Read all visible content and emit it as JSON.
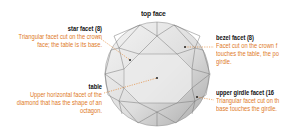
{
  "title": "top face",
  "labels": {
    "star_facet": {
      "heading": "star facet (8)",
      "description_lines": [
        "Triangular facet cut on the crown",
        "face; the table is its base."
      ]
    },
    "table": {
      "heading": "table",
      "description_lines": [
        "Upper horizontal facet of the",
        "diamond that has the shape of an",
        "octagon."
      ]
    },
    "bezel_facet": {
      "heading": "bezel facet (8)",
      "description_lines": [
        "Facet cut on the crown f",
        "touches the table, the po",
        "girdle."
      ]
    },
    "upper_girdle_facet": {
      "heading": "upper girdle facet (16",
      "description_lines": [
        "Triangular facet cut on th",
        "base touches the girdle."
      ]
    }
  },
  "colors": {
    "heading": "#111111",
    "description": "#e07a1f",
    "leader": "#e07a1f",
    "facet_light": "#efefef",
    "facet_mid": "#d6d6d6",
    "facet_dark": "#b9b9b9",
    "edge": "#777777"
  }
}
